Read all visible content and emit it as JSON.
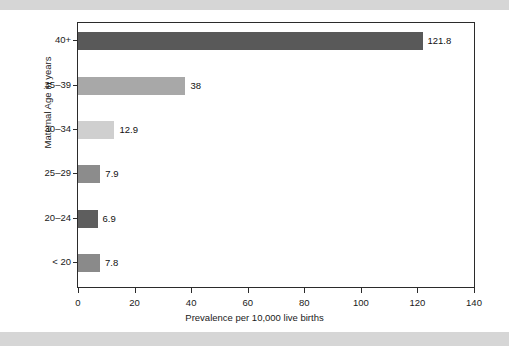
{
  "figure": {
    "background_color": "#ffffff",
    "band_color": "#d6d6d6",
    "frame_color": "#2b2b2b"
  },
  "chart_data": {
    "type": "bar",
    "orientation": "horizontal",
    "title": "",
    "xlabel": "Prevalence per 10,000 live births",
    "ylabel": "Maternal Age in years",
    "categories": [
      "40+",
      "35–39",
      "30–34",
      "25–29",
      "20–24",
      "< 20"
    ],
    "values": [
      121.8,
      38,
      12.9,
      7.9,
      6.9,
      7.8
    ],
    "value_labels": [
      "121.8",
      "38",
      "12.9",
      "7.9",
      "6.9",
      "7.8"
    ],
    "bar_colors": [
      "#595959",
      "#a8a8a8",
      "#cfcfcf",
      "#8c8c8c",
      "#5e5e5e",
      "#8a8a8a"
    ],
    "xlim": [
      0,
      140
    ],
    "ylim_categorical": true,
    "xticks": [
      0,
      20,
      40,
      60,
      80,
      100,
      120,
      140
    ],
    "xtick_labels": [
      "0",
      "20",
      "40",
      "60",
      "80",
      "100",
      "120",
      "140"
    ],
    "grid": false,
    "legend": false,
    "legend_position": "none"
  }
}
